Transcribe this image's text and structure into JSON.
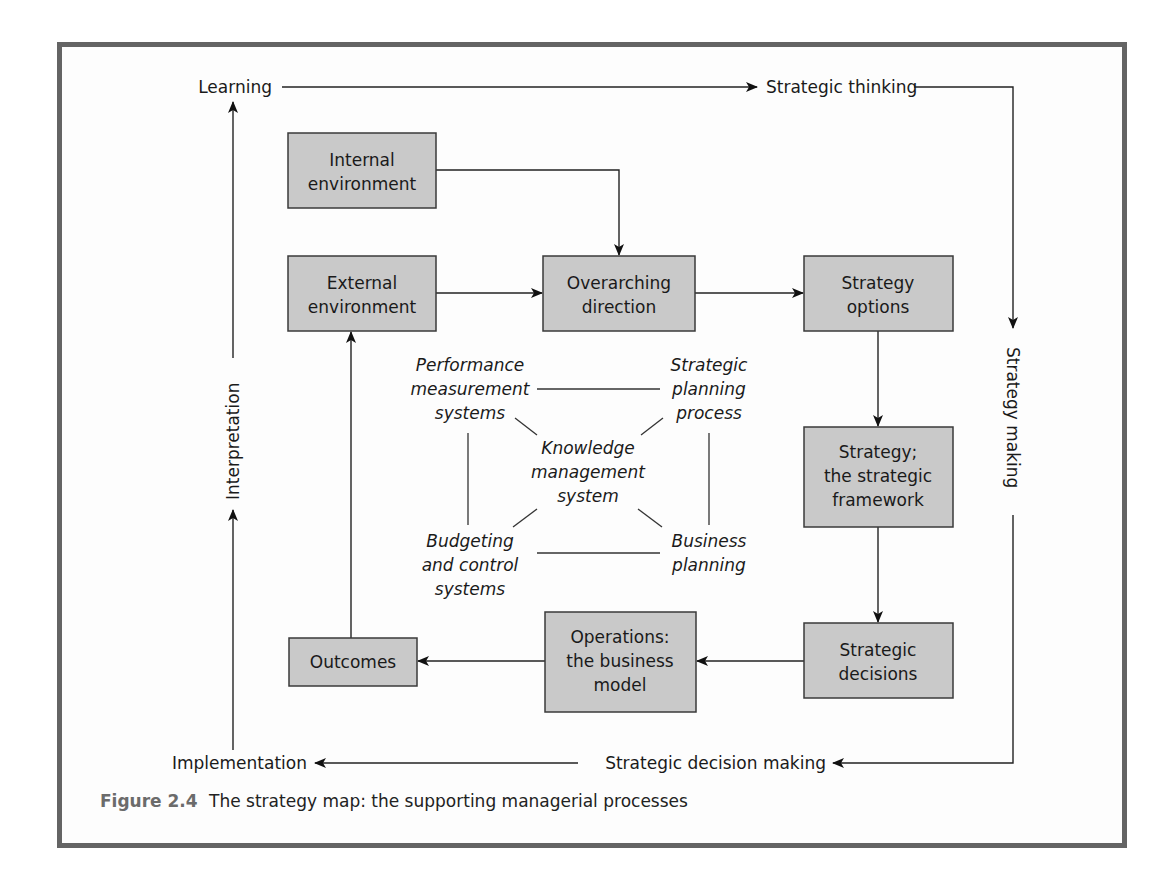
{
  "figure": {
    "number": "Figure 2.4",
    "caption": "The strategy map: the supporting managerial processes"
  },
  "flow_labels": {
    "learning": "Learning",
    "strategic_thinking": "Strategic thinking",
    "strategy_making": "Strategy making",
    "strategic_decision_making": "Strategic decision making",
    "implementation": "Implementation",
    "interpretation": "Interpretation"
  },
  "boxes": {
    "internal_environment": [
      "Internal",
      "environment"
    ],
    "external_environment": [
      "External",
      "environment"
    ],
    "overarching_direction": [
      "Overarching",
      "direction"
    ],
    "strategy_options": [
      "Strategy",
      "options"
    ],
    "strategy_framework": [
      "Strategy;",
      "the strategic",
      "framework"
    ],
    "strategic_decisions": [
      "Strategic",
      "decisions"
    ],
    "operations": [
      "Operations:",
      "the business",
      "model"
    ],
    "outcomes": [
      "Outcomes"
    ]
  },
  "processes": {
    "performance_measurement": [
      "Performance",
      "measurement",
      "systems"
    ],
    "strategic_planning": [
      "Strategic",
      "planning",
      "process"
    ],
    "knowledge_management": [
      "Knowledge",
      "management",
      "system"
    ],
    "budgeting_control": [
      "Budgeting",
      "and control",
      "systems"
    ],
    "business_planning": [
      "Business",
      "planning"
    ]
  },
  "colors": {
    "box_fill": "#c9c9c9",
    "box_border": "#3a3a3a",
    "frame_border": "#646464",
    "figure_label": "#6b6b6b"
  }
}
